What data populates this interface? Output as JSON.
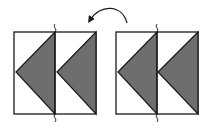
{
  "diagram": {
    "colors": {
      "stroke": "#1a1a1a",
      "fill": "#6e6e6e",
      "background": "#ffffff"
    },
    "panels": [
      {
        "id": "left-panel",
        "x": 14,
        "y": 32,
        "w": 82,
        "h": 82,
        "divider_x": 55,
        "triangles": [
          {
            "points": "16,72 55,32 55,114"
          },
          {
            "points": "57,72 96,32 96,114"
          }
        ]
      },
      {
        "id": "right-panel",
        "x": 116,
        "y": 32,
        "w": 82,
        "h": 82,
        "divider_x": 157,
        "triangles": [
          {
            "points": "118,72 157,32 157,114"
          },
          {
            "points": "158,72 198,32 198,114"
          }
        ]
      }
    ],
    "arrow": {
      "from": "right",
      "to": "left",
      "shape": "curved"
    }
  }
}
